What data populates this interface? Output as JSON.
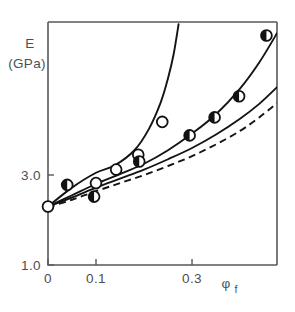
{
  "chart_data": {
    "type": "line",
    "title": "",
    "subtitle": "",
    "xlabel": "φ",
    "xlabel_sub": "f",
    "ylabel_line1": "E",
    "ylabel_line2": "(GPa)",
    "xlim": [
      0.0,
      0.477
    ],
    "ylim": [
      1.0,
      6.4
    ],
    "grid": false,
    "legend": "none",
    "xticks": [
      0.0,
      0.1,
      0.3
    ],
    "xticklabels": [
      "0",
      "0.1",
      "0.3"
    ],
    "yticks": [
      1.0,
      3.0
    ],
    "yticklabels": [
      "1.0",
      "3.0"
    ],
    "series": [
      {
        "name": "steep-curve",
        "style": "solid",
        "x": [
          0.0,
          0.05,
          0.1,
          0.14,
          0.18,
          0.21,
          0.235,
          0.25,
          0.262,
          0.272
        ],
        "y": [
          2.3,
          2.72,
          3.05,
          3.22,
          3.55,
          4.02,
          4.62,
          5.15,
          5.7,
          6.35
        ]
      },
      {
        "name": "middle-curve",
        "style": "solid",
        "x": [
          0.0,
          0.05,
          0.1,
          0.15,
          0.2,
          0.25,
          0.3,
          0.35,
          0.4,
          0.44,
          0.477
        ],
        "y": [
          2.3,
          2.55,
          2.8,
          3.02,
          3.25,
          3.55,
          3.92,
          4.35,
          4.92,
          5.5,
          6.15
        ]
      },
      {
        "name": "lower-solid-curve",
        "style": "solid",
        "x": [
          0.0,
          0.05,
          0.1,
          0.15,
          0.2,
          0.25,
          0.3,
          0.35,
          0.4,
          0.44,
          0.477
        ],
        "y": [
          2.3,
          2.5,
          2.72,
          2.92,
          3.12,
          3.35,
          3.6,
          3.9,
          4.25,
          4.58,
          4.95
        ]
      },
      {
        "name": "lower-dashed-curve",
        "style": "dashed",
        "x": [
          0.0,
          0.05,
          0.1,
          0.15,
          0.2,
          0.25,
          0.3,
          0.35,
          0.4,
          0.44,
          0.477
        ],
        "y": [
          2.28,
          2.45,
          2.64,
          2.82,
          3.0,
          3.2,
          3.42,
          3.68,
          3.98,
          4.28,
          4.6
        ]
      }
    ],
    "points_open": [
      {
        "x": 0.0,
        "y": 2.3
      },
      {
        "x": 0.1,
        "y": 2.82
      },
      {
        "x": 0.142,
        "y": 3.12
      },
      {
        "x": 0.188,
        "y": 3.45
      },
      {
        "x": 0.238,
        "y": 4.18
      }
    ],
    "points_half_filled": [
      {
        "x": 0.04,
        "y": 2.78
      },
      {
        "x": 0.096,
        "y": 2.52
      },
      {
        "x": 0.19,
        "y": 3.3
      },
      {
        "x": 0.295,
        "y": 3.88
      },
      {
        "x": 0.347,
        "y": 4.28
      },
      {
        "x": 0.398,
        "y": 4.75
      },
      {
        "x": 0.455,
        "y": 6.1
      }
    ]
  }
}
